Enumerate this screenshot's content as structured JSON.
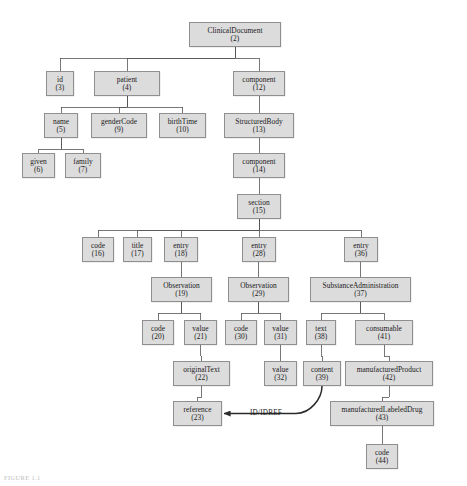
{
  "figure": {
    "caption": "FIGURE 1.1",
    "reference_edge_label": "ID/IDREF",
    "colors": {
      "node_fill": "#dcdcdc",
      "node_border": "#8f8f8f",
      "edge": "#555555",
      "text": "#1a1a1a"
    }
  },
  "diagram": {
    "type": "tree",
    "nodes": [
      {
        "id": "n2",
        "label": "ClinicalDocument",
        "number": "(2)",
        "x": 189,
        "y": 22,
        "w": 92,
        "h": 25
      },
      {
        "id": "n3",
        "label": "id",
        "number": "(3)",
        "x": 46,
        "y": 71,
        "w": 28,
        "h": 25
      },
      {
        "id": "n4",
        "label": "patient",
        "number": "(4)",
        "x": 94,
        "y": 71,
        "w": 66,
        "h": 25
      },
      {
        "id": "n12",
        "label": "component",
        "number": "(12)",
        "x": 233,
        "y": 71,
        "w": 52,
        "h": 25
      },
      {
        "id": "n5",
        "label": "name",
        "number": "(5)",
        "x": 44,
        "y": 113,
        "w": 34,
        "h": 25
      },
      {
        "id": "n9",
        "label": "genderCode",
        "number": "(9)",
        "x": 91,
        "y": 113,
        "w": 56,
        "h": 25
      },
      {
        "id": "n10",
        "label": "birthTime",
        "number": "(10)",
        "x": 159,
        "y": 113,
        "w": 47,
        "h": 25
      },
      {
        "id": "n13",
        "label": "StructuredBody",
        "number": "(13)",
        "x": 224,
        "y": 113,
        "w": 70,
        "h": 25
      },
      {
        "id": "n6",
        "label": "given",
        "number": "(6)",
        "x": 22,
        "y": 153,
        "w": 33,
        "h": 25
      },
      {
        "id": "n7",
        "label": "family",
        "number": "(7)",
        "x": 65,
        "y": 153,
        "w": 36,
        "h": 25
      },
      {
        "id": "n14",
        "label": "component",
        "number": "(14)",
        "x": 233,
        "y": 153,
        "w": 52,
        "h": 25
      },
      {
        "id": "n15",
        "label": "section",
        "number": "(15)",
        "x": 237,
        "y": 194,
        "w": 44,
        "h": 25
      },
      {
        "id": "n16",
        "label": "code",
        "number": "(16)",
        "x": 82,
        "y": 237,
        "w": 32,
        "h": 25
      },
      {
        "id": "n17",
        "label": "title",
        "number": "(17)",
        "x": 123,
        "y": 237,
        "w": 29,
        "h": 25
      },
      {
        "id": "n18",
        "label": "entry",
        "number": "(18)",
        "x": 164,
        "y": 237,
        "w": 34,
        "h": 25
      },
      {
        "id": "n28",
        "label": "entry",
        "number": "(28)",
        "x": 242,
        "y": 237,
        "w": 34,
        "h": 25
      },
      {
        "id": "n36",
        "label": "entry",
        "number": "(36)",
        "x": 344,
        "y": 237,
        "w": 34,
        "h": 25
      },
      {
        "id": "n19",
        "label": "Observation",
        "number": "(19)",
        "x": 151,
        "y": 277,
        "w": 61,
        "h": 25
      },
      {
        "id": "n29",
        "label": "Observation",
        "number": "(29)",
        "x": 228,
        "y": 277,
        "w": 61,
        "h": 25
      },
      {
        "id": "n37",
        "label": "SubstanceAdministration",
        "number": "(37)",
        "x": 310,
        "y": 277,
        "w": 101,
        "h": 25
      },
      {
        "id": "n20",
        "label": "code",
        "number": "(20)",
        "x": 142,
        "y": 320,
        "w": 32,
        "h": 25
      },
      {
        "id": "n21",
        "label": "value",
        "number": "(21)",
        "x": 184,
        "y": 320,
        "w": 33,
        "h": 25
      },
      {
        "id": "n30",
        "label": "code",
        "number": "(30)",
        "x": 225,
        "y": 320,
        "w": 32,
        "h": 25
      },
      {
        "id": "n31",
        "label": "value",
        "number": "(31)",
        "x": 264,
        "y": 320,
        "w": 33,
        "h": 25
      },
      {
        "id": "n38",
        "label": "text",
        "number": "(38)",
        "x": 306,
        "y": 320,
        "w": 30,
        "h": 25
      },
      {
        "id": "n41",
        "label": "consumable",
        "number": "(41)",
        "x": 355,
        "y": 320,
        "w": 58,
        "h": 25
      },
      {
        "id": "n22",
        "label": "originalText",
        "number": "(22)",
        "x": 173,
        "y": 361,
        "w": 57,
        "h": 25
      },
      {
        "id": "n32",
        "label": "value",
        "number": "(32)",
        "x": 264,
        "y": 361,
        "w": 33,
        "h": 25
      },
      {
        "id": "n39",
        "label": "content",
        "number": "(39)",
        "x": 303,
        "y": 361,
        "w": 38,
        "h": 25
      },
      {
        "id": "n42",
        "label": "manufacturedProduct",
        "number": "(42)",
        "x": 345,
        "y": 361,
        "w": 88,
        "h": 25
      },
      {
        "id": "n23",
        "label": "reference",
        "number": "(23)",
        "x": 173,
        "y": 401,
        "w": 49,
        "h": 25
      },
      {
        "id": "n43",
        "label": "manufacturedLabeledDrug",
        "number": "(43)",
        "x": 330,
        "y": 401,
        "w": 104,
        "h": 25
      },
      {
        "id": "n44",
        "label": "code",
        "number": "(44)",
        "x": 366,
        "y": 444,
        "w": 32,
        "h": 25
      }
    ],
    "edges": [
      {
        "from": "n2",
        "to": "n3"
      },
      {
        "from": "n2",
        "to": "n4"
      },
      {
        "from": "n2",
        "to": "n12"
      },
      {
        "from": "n4",
        "to": "n5"
      },
      {
        "from": "n4",
        "to": "n9"
      },
      {
        "from": "n4",
        "to": "n10"
      },
      {
        "from": "n5",
        "to": "n6"
      },
      {
        "from": "n5",
        "to": "n7"
      },
      {
        "from": "n12",
        "to": "n13"
      },
      {
        "from": "n13",
        "to": "n14"
      },
      {
        "from": "n14",
        "to": "n15"
      },
      {
        "from": "n15",
        "to": "n16"
      },
      {
        "from": "n15",
        "to": "n17"
      },
      {
        "from": "n15",
        "to": "n18"
      },
      {
        "from": "n15",
        "to": "n28"
      },
      {
        "from": "n15",
        "to": "n36"
      },
      {
        "from": "n18",
        "to": "n19"
      },
      {
        "from": "n28",
        "to": "n29"
      },
      {
        "from": "n36",
        "to": "n37"
      },
      {
        "from": "n19",
        "to": "n20"
      },
      {
        "from": "n19",
        "to": "n21"
      },
      {
        "from": "n29",
        "to": "n30"
      },
      {
        "from": "n29",
        "to": "n31"
      },
      {
        "from": "n37",
        "to": "n38"
      },
      {
        "from": "n37",
        "to": "n41"
      },
      {
        "from": "n21",
        "to": "n22"
      },
      {
        "from": "n31",
        "to": "n32"
      },
      {
        "from": "n38",
        "to": "n39"
      },
      {
        "from": "n41",
        "to": "n42"
      },
      {
        "from": "n22",
        "to": "n23"
      },
      {
        "from": "n42",
        "to": "n43"
      },
      {
        "from": "n43",
        "to": "n44"
      }
    ],
    "reference_edge": {
      "from": "n39",
      "to": "n23",
      "label": "ID/IDREF"
    }
  }
}
